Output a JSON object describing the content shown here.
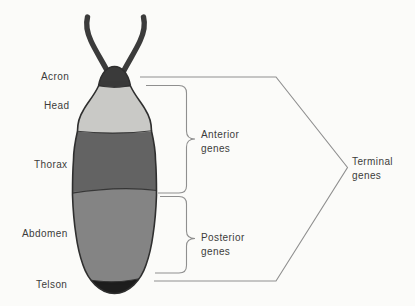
{
  "diagram": {
    "type": "labeled-anatomy-diagram",
    "body_regions": [
      {
        "label": "Acron"
      },
      {
        "label": "Head"
      },
      {
        "label": "Thorax"
      },
      {
        "label": "Abdomen"
      },
      {
        "label": "Telson"
      }
    ],
    "gene_groups": [
      {
        "name": "anterior",
        "line1": "Anterior",
        "line2": "genes",
        "spans": "Acron–Thorax"
      },
      {
        "name": "posterior",
        "line1": "Posterior",
        "line2": "genes",
        "spans": "Abdomen"
      },
      {
        "name": "terminal",
        "line1": "Terminal",
        "line2": "genes",
        "spans": "Acron–Telson"
      }
    ],
    "colors": {
      "background": "#fbfbf9",
      "antennae": "#3b3b3b",
      "acron": "#3a3a3a",
      "head": "#c9c9c6",
      "thorax": "#636363",
      "abdomen": "#848484",
      "telson": "#1d1d1d",
      "outline": "#2f2f2f",
      "bracket": "#8f8f8f",
      "text": "#3b3b3b"
    }
  }
}
